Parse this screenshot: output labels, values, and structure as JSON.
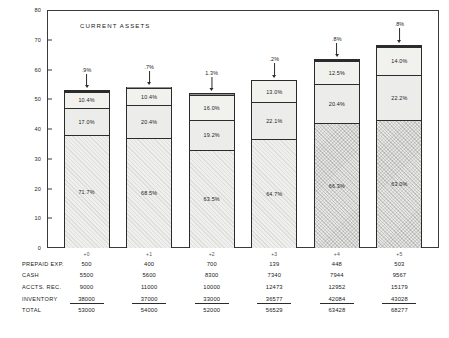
{
  "chart_data": {
    "type": "bar",
    "title": "CURRENT ASSETS",
    "xlabel": "",
    "ylabel": "",
    "ylim": [
      0,
      80
    ],
    "yticks": [
      "0",
      "10",
      "20",
      "30",
      "40",
      "50",
      "60",
      "70",
      "80"
    ],
    "grid": false,
    "legend": "none",
    "stacked": true,
    "categories": [
      "+0",
      "+1",
      "+2",
      "+3",
      "+4",
      "+5"
    ],
    "series": [
      {
        "name": "INVENTORY",
        "values": [
          38000,
          37000,
          33000,
          36577,
          42084,
          43028
        ],
        "pct": [
          "71.7%",
          "68.5%",
          "63.5%",
          "64.7%",
          "66.3%",
          "63.0%"
        ]
      },
      {
        "name": "ACCTS. REC.",
        "values": [
          9000,
          11000,
          10000,
          12473,
          12952,
          15179
        ],
        "pct": [
          "17.0%",
          "20.4%",
          "19.2%",
          "22.1%",
          "20.4%",
          "22.2%"
        ]
      },
      {
        "name": "CASH",
        "values": [
          5500,
          5600,
          8300,
          7340,
          7944,
          9567
        ],
        "pct": [
          "10.4%",
          "10.4%",
          "16.0%",
          "13.0%",
          "12.5%",
          "14.0%"
        ]
      },
      {
        "name": "PREPAID EXP.",
        "values": [
          500,
          400,
          700,
          139,
          448,
          503
        ],
        "pct": [
          ".9%",
          ".7%",
          "1.3%",
          ".2%",
          ".8%",
          ".8%"
        ]
      }
    ],
    "totals": [
      53000,
      54000,
      52000,
      56529,
      63428,
      68277
    ],
    "totals_thousands": [
      53.0,
      54.0,
      52.0,
      56.529,
      63.428,
      68.277
    ]
  },
  "table": {
    "column_headers": [
      "+0",
      "+1",
      "+2",
      "+3",
      "+4",
      "+5"
    ],
    "rows": [
      {
        "label": "PREPAID EXP.",
        "values": [
          "500",
          "400",
          "700",
          "139",
          "448",
          "503"
        ]
      },
      {
        "label": "CASH",
        "values": [
          "5500",
          "5600",
          "8300",
          "7340",
          "7944",
          "9567"
        ]
      },
      {
        "label": "ACCTS. REC.",
        "values": [
          "9000",
          "11000",
          "10000",
          "12473",
          "12952",
          "15179"
        ]
      },
      {
        "label": "INVENTORY",
        "values": [
          "38000",
          "37000",
          "33000",
          "36577",
          "42084",
          "43028"
        ]
      },
      {
        "label": "TOTAL",
        "values": [
          "53000",
          "54000",
          "52000",
          "56529",
          "63428",
          "68277"
        ]
      }
    ]
  },
  "colors": {
    "ink": "#1a1a1a",
    "frame": "#3a3a3a",
    "prepaid": "#8e8e8e",
    "cash": "#f1f1ee",
    "accts": "#ececeb",
    "inventory": "#efefed"
  }
}
